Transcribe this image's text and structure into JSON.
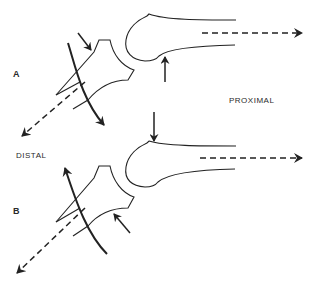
{
  "diagram": {
    "panels": [
      {
        "id": "A",
        "label": "A"
      },
      {
        "id": "B",
        "label": "B"
      }
    ],
    "directions": {
      "proximal": "PROXIMAL",
      "distal": "DISTAL"
    },
    "colors": {
      "line": "#222222",
      "background": "#ffffff"
    }
  }
}
